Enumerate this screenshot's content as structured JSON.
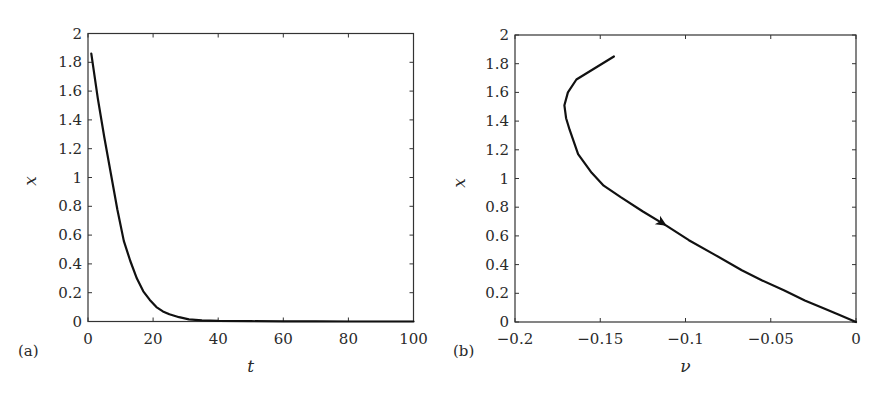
{
  "chart_data": [
    {
      "panel": "(a)",
      "type": "line",
      "title": "",
      "xlabel": "t",
      "ylabel": "x",
      "xlim": [
        0,
        100
      ],
      "ylim": [
        0,
        2
      ],
      "xticks": [
        0,
        20,
        40,
        60,
        80,
        100
      ],
      "yticks": [
        0,
        0.2,
        0.4,
        0.6,
        0.8,
        1,
        1.2,
        1.4,
        1.6,
        1.8,
        2
      ],
      "xtick_labels": [
        "0",
        "20",
        "40",
        "60",
        "80",
        "100"
      ],
      "ytick_labels": [
        "0",
        "0.2",
        "0.4",
        "0.6",
        "0.8",
        "1",
        "1.2",
        "1.4",
        "1.6",
        "1.8",
        "2"
      ],
      "grid": false,
      "series": [
        {
          "name": "x(t)",
          "color": "#111111",
          "x": [
            1,
            3,
            5,
            7,
            9,
            11,
            13,
            15,
            17,
            19,
            21,
            23,
            25,
            28,
            31,
            35,
            40,
            50,
            60,
            70,
            80,
            90,
            100
          ],
          "y": [
            1.86,
            1.55,
            1.28,
            1.03,
            0.78,
            0.56,
            0.42,
            0.3,
            0.21,
            0.15,
            0.1,
            0.07,
            0.05,
            0.03,
            0.015,
            0.008,
            0.004,
            0.002,
            0.001,
            0.0005,
            0.0003,
            0.0002,
            0.0001
          ]
        }
      ]
    },
    {
      "panel": "(b)",
      "type": "line",
      "title": "",
      "xlabel": "ν",
      "ylabel": "x",
      "xlim": [
        -0.2,
        0
      ],
      "ylim": [
        0,
        2
      ],
      "xticks": [
        -0.2,
        -0.15,
        -0.1,
        -0.05,
        0
      ],
      "yticks": [
        0,
        0.2,
        0.4,
        0.6,
        0.8,
        1,
        1.2,
        1.4,
        1.6,
        1.8,
        2
      ],
      "xtick_labels": [
        "−0.2",
        "−0.15",
        "−0.1",
        "−0.05",
        "0"
      ],
      "ytick_labels": [
        "0",
        "0.2",
        "0.4",
        "0.6",
        "0.8",
        "1",
        "1.2",
        "1.4",
        "1.6",
        "1.8",
        "2"
      ],
      "grid": false,
      "annotations": [
        {
          "type": "arrow",
          "at": [
            -0.111,
            0.67
          ],
          "direction": "along-curve toward origin"
        }
      ],
      "series": [
        {
          "name": "phase trajectory",
          "color": "#111111",
          "x": [
            -0.142,
            -0.164,
            -0.169,
            -0.171,
            -0.17,
            -0.168,
            -0.163,
            -0.155,
            -0.148,
            -0.138,
            -0.125,
            -0.111,
            -0.098,
            -0.083,
            -0.067,
            -0.055,
            -0.042,
            -0.03,
            -0.018,
            -0.01,
            0
          ],
          "y": [
            1.85,
            1.69,
            1.6,
            1.51,
            1.42,
            1.34,
            1.17,
            1.04,
            0.95,
            0.87,
            0.77,
            0.67,
            0.57,
            0.47,
            0.36,
            0.29,
            0.22,
            0.15,
            0.09,
            0.05,
            0
          ]
        }
      ]
    }
  ],
  "panels": {
    "a": {
      "label": "(a)"
    },
    "b": {
      "label": "(b)"
    }
  }
}
